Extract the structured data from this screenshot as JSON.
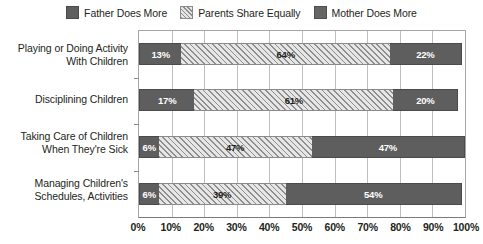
{
  "legend": {
    "items": [
      {
        "label": "Father Does More",
        "swatch": "solid-dark",
        "color": "#5e5e5e"
      },
      {
        "label": "Parents Share Equally",
        "swatch": "hatch",
        "color": "#d2d2d2"
      },
      {
        "label": "Mother Does More",
        "swatch": "solid-mid",
        "color": "#5e5e5e"
      }
    ]
  },
  "chart_data": {
    "type": "bar",
    "orientation": "horizontal",
    "stacked": true,
    "stacked_100": true,
    "title": "",
    "subtitle": "",
    "xlabel": "",
    "ylabel": "",
    "xlim": [
      0,
      100
    ],
    "grid": true,
    "legend_position": "top",
    "categories": [
      "Playing or Doing Activity With Children",
      "Disciplining Children",
      "Taking Care of Children When They're Sick",
      "Managing Children's Schedules, Activities"
    ],
    "category_lines": [
      [
        "Playing or Doing Activity",
        "With Children"
      ],
      [
        "Disciplining Children"
      ],
      [
        "Taking Care of Children",
        "When They're Sick"
      ],
      [
        "Managing Children's",
        "Schedules, Activities"
      ]
    ],
    "series": [
      {
        "name": "Father Does More",
        "values": [
          13,
          17,
          6,
          6
        ]
      },
      {
        "name": "Parents Share Equally",
        "values": [
          64,
          61,
          47,
          39
        ]
      },
      {
        "name": "Mother Does More",
        "values": [
          22,
          20,
          47,
          54
        ]
      }
    ],
    "data_labels": [
      [
        "13%",
        "64%",
        "22%"
      ],
      [
        "17%",
        "61%",
        "20%"
      ],
      [
        "6%",
        "47%",
        "47%"
      ],
      [
        "6%",
        "39%",
        "54%"
      ]
    ],
    "xticks": [
      0,
      10,
      20,
      30,
      40,
      50,
      60,
      70,
      80,
      90,
      100
    ],
    "xtick_labels": [
      "0%",
      "10%",
      "20%",
      "30%",
      "40%",
      "50%",
      "60%",
      "70%",
      "80%",
      "90%",
      "100%"
    ]
  }
}
